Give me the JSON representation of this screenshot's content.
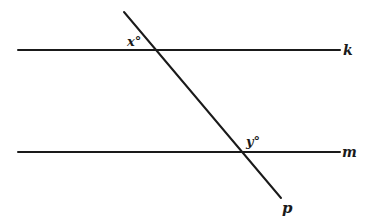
{
  "diagram": {
    "lines": {
      "k": {
        "label": "k"
      },
      "m": {
        "label": "m"
      },
      "p": {
        "label": "p"
      }
    },
    "angles": {
      "x": {
        "label": "x°"
      },
      "y": {
        "label": "y°"
      }
    },
    "colors": {
      "ink": "#1a1a1a",
      "background": "#ffffff"
    }
  }
}
